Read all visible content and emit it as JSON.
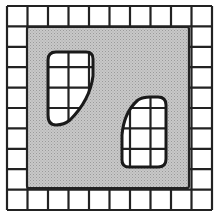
{
  "figure": {
    "grid": {
      "columns": 10,
      "rows": 10
    },
    "panel": {
      "covered_columns": [
        1,
        8
      ],
      "covered_rows": [
        1,
        8
      ]
    },
    "windows": [
      {
        "name": "upper-left-window",
        "shape": "rounded trapezoid, straight left side, slanted lower-right side"
      },
      {
        "name": "lower-right-window",
        "shape": "rounded trapezoid, straight right side, slanted upper-left side"
      }
    ],
    "colors": {
      "background": "#ffffff",
      "line": "#222222",
      "panel_fill": "#c8c8c8",
      "panel_dots": "#9a9a9a"
    }
  }
}
